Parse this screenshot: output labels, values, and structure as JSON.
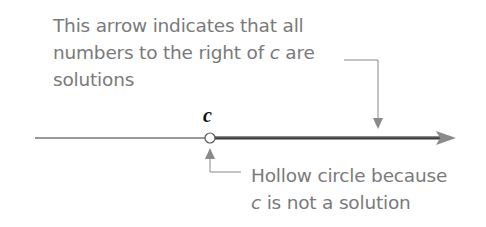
{
  "annotation_top": {
    "line1": "This arrow indicates that all",
    "line2_pre": "numbers to the right of ",
    "line2_var": "c",
    "line2_post": " are",
    "line3": "solutions"
  },
  "point_label": "c",
  "annotation_bottom": {
    "line1": "Hollow circle because",
    "line2_var": "c",
    "line2_post": " is not a solution"
  },
  "colors": {
    "annotation_text": "#7a7a7a",
    "solution_ray": "#5a5a5a",
    "number_line": "#333333",
    "callout": "#8a8a8a"
  }
}
